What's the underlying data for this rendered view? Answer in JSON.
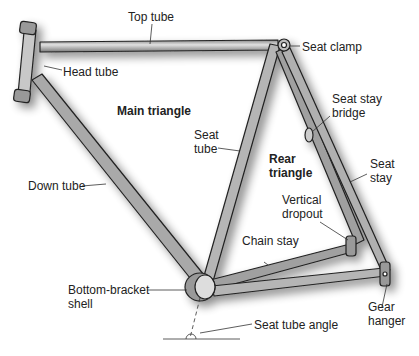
{
  "diagram": {
    "labels": {
      "top_tube": "Top tube",
      "head_tube": "Head tube",
      "seat_clamp": "Seat clamp",
      "main_triangle": "Main triangle",
      "seat_stay_bridge_1": "Seat stay",
      "seat_stay_bridge_2": "bridge",
      "seat_tube_1": "Seat",
      "seat_tube_2": "tube",
      "rear_triangle_1": "Rear",
      "rear_triangle_2": "triangle",
      "seat_stay_1": "Seat",
      "seat_stay_2": "stay",
      "down_tube": "Down tube",
      "vertical_dropout_1": "Vertical",
      "vertical_dropout_2": "dropout",
      "chain_stay": "Chain stay",
      "bottom_bracket_1": "Bottom-bracket",
      "bottom_bracket_2": "shell",
      "gear_hanger_1": "Gear",
      "gear_hanger_2": "hanger",
      "seat_tube_angle": "Seat tube angle"
    },
    "colors": {
      "tube_fill": "#a8a8a8",
      "tube_edge": "#222222",
      "text": "#222222"
    }
  }
}
